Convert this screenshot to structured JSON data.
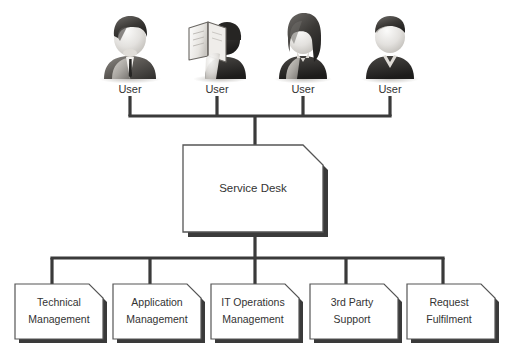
{
  "diagram": {
    "type": "organizational-hierarchy",
    "background_color": "#ffffff",
    "line_color": "#3a3a3a",
    "box_fill": "#ffffff",
    "box_border_color": "#555555",
    "shadow_color": "#3a3a3a",
    "text_color": "#333333"
  },
  "users": {
    "label_text": "User",
    "items": [
      {
        "label": "User",
        "icon": "user-businessman-icon",
        "x": 130
      },
      {
        "label": "User",
        "icon": "user-reader-icon",
        "x": 217
      },
      {
        "label": "User",
        "icon": "user-woman-icon",
        "x": 303
      },
      {
        "label": "User",
        "icon": "user-casual-icon",
        "x": 390
      }
    ]
  },
  "service_desk": {
    "label": "Service Desk",
    "x": 183,
    "y": 145,
    "width": 140,
    "height": 87,
    "bevel": 20
  },
  "functions": {
    "items": [
      {
        "line1": "Technical",
        "line2": "Management",
        "x": 15
      },
      {
        "line1": "Application",
        "line2": "Management",
        "x": 113
      },
      {
        "line1": "IT Operations",
        "line2": "Management",
        "x": 211
      },
      {
        "line1": "3rd Party",
        "line2": "Support",
        "x": 310
      },
      {
        "line1": "Request",
        "line2": "Fulfilment",
        "x": 407
      }
    ],
    "box_width": 88,
    "box_height": 55,
    "box_top": 283,
    "bevel": 14
  },
  "connectors": {
    "top_bus_y": 116,
    "top_bus_x1": 130,
    "top_bus_x2": 390,
    "trunk_x": 255,
    "bottom_bus_y": 258,
    "bottom_bus_x1": 52,
    "bottom_bus_x2": 443
  }
}
